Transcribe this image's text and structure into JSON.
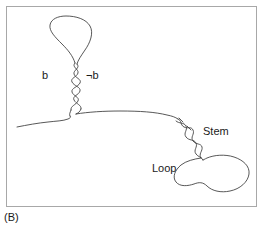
{
  "figure": {
    "caption": "(B)",
    "domain": "molecular-secondary-structure-diagram",
    "background_color": "#ffffff",
    "stroke_color": "#3a3a3a",
    "frame_color": "#a8a8a8",
    "text_color": "#1a1a1a"
  },
  "labels": {
    "left_strand": "b",
    "right_strand": "¬b",
    "stem": "Stem",
    "loop": "Loop"
  },
  "structures": [
    {
      "name": "upper-hairpin",
      "loop_shape": "teardrop",
      "stem_orientation": "vertical",
      "labels": [
        "b",
        "¬b"
      ]
    },
    {
      "name": "lower-hairpin",
      "loop_shape": "irregular-blob",
      "stem_orientation": "diagonal",
      "labels": [
        "Stem",
        "Loop"
      ]
    }
  ]
}
